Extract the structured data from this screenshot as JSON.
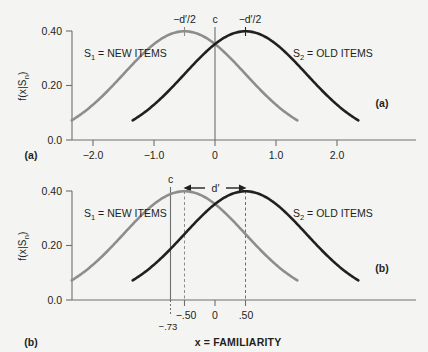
{
  "figure": {
    "background_color": "#f4f4f2",
    "axis_color": "#6d6e71",
    "text_color": "#231f20"
  },
  "chart_data": [
    {
      "type": "line",
      "panel_tag_left": "(a)",
      "panel_tag_right": "(a)",
      "title": "",
      "xlabel": "",
      "ylabel": "f(x|S",
      "ylabel_sub": "n",
      "ylabel_tail": ")",
      "xlim": [
        -2.4,
        2.45
      ],
      "ylim": [
        0,
        0.44
      ],
      "grid": false,
      "xticks": [
        -2.0,
        -1.0,
        0,
        1.0,
        2.0
      ],
      "xticklabels": [
        "−2.0",
        "−1.0",
        "0",
        "1.0",
        "2.0"
      ],
      "yticks": [
        0.0,
        0.2,
        0.4
      ],
      "yticklabels": [
        "0.0",
        "0.20",
        "0.40"
      ],
      "series": [
        {
          "name": "S1 = NEW ITEMS",
          "label_main": "S",
          "label_sub": "1",
          "label_tail": " = NEW ITEMS",
          "color": "#8d8d8d",
          "distribution": "normal",
          "mean": -0.5,
          "sd": 1.0,
          "peak": 0.3989
        },
        {
          "name": "S2 = OLD ITEMS",
          "label_main": "S",
          "label_sub": "2",
          "label_tail": " = OLD ITEMS",
          "color": "#231f20",
          "distribution": "normal",
          "mean": 0.5,
          "sd": 1.0,
          "peak": 0.3989
        }
      ],
      "annotations": [
        {
          "name": "left-peak-label",
          "text": "−d′/2",
          "x": -0.5,
          "y": 0.4
        },
        {
          "name": "right-peak-label",
          "text": "−d′/2",
          "x": 0.5,
          "y": 0.4
        },
        {
          "name": "criterion-label",
          "text": "c",
          "x": 0,
          "y": 0.43
        }
      ],
      "criterion": {
        "label": "c",
        "value": 0.0
      }
    },
    {
      "type": "line",
      "panel_tag_left": "(b)",
      "panel_tag_right": "(b)",
      "title": "",
      "xlabel": "x = FAMILIARITY",
      "ylabel": "f(x|S",
      "ylabel_sub": "n",
      "ylabel_tail": ")",
      "xlim": [
        -2.4,
        2.45
      ],
      "ylim": [
        0,
        0.44
      ],
      "grid": false,
      "xticks": [
        -0.5,
        0,
        0.5
      ],
      "xticklabels": [
        "−.50",
        "0",
        ".50"
      ],
      "yticks": [
        0.0,
        0.2,
        0.4
      ],
      "yticklabels": [
        "0.0",
        "0.20",
        "0.40"
      ],
      "series": [
        {
          "name": "S1 = NEW ITEMS",
          "label_main": "S",
          "label_sub": "1",
          "label_tail": " = NEW ITEMS",
          "color": "#8d8d8d",
          "distribution": "normal",
          "mean": -0.5,
          "sd": 1.0,
          "peak": 0.3989
        },
        {
          "name": "S2 = OLD ITEMS",
          "label_main": "S",
          "label_sub": "2",
          "label_tail": " = OLD ITEMS",
          "color": "#231f20",
          "distribution": "normal",
          "mean": 0.5,
          "sd": 1.0,
          "peak": 0.3989
        }
      ],
      "annotations": [
        {
          "name": "criterion-label",
          "text": "c",
          "x": -0.73,
          "y": 0.43
        },
        {
          "name": "dprime-label",
          "text": "d′",
          "x": 0.0,
          "y": 0.425
        },
        {
          "name": "criterion-value-label",
          "text": "−.73",
          "x": -0.73,
          "y": -0.06
        }
      ],
      "criterion": {
        "label": "c",
        "value": -0.73,
        "value_label": "−.73"
      },
      "dprime": {
        "label": "d′",
        "from": -0.5,
        "to": 0.5,
        "value": 1.0
      },
      "dashed_markers": [
        -0.5,
        0.5
      ]
    }
  ]
}
